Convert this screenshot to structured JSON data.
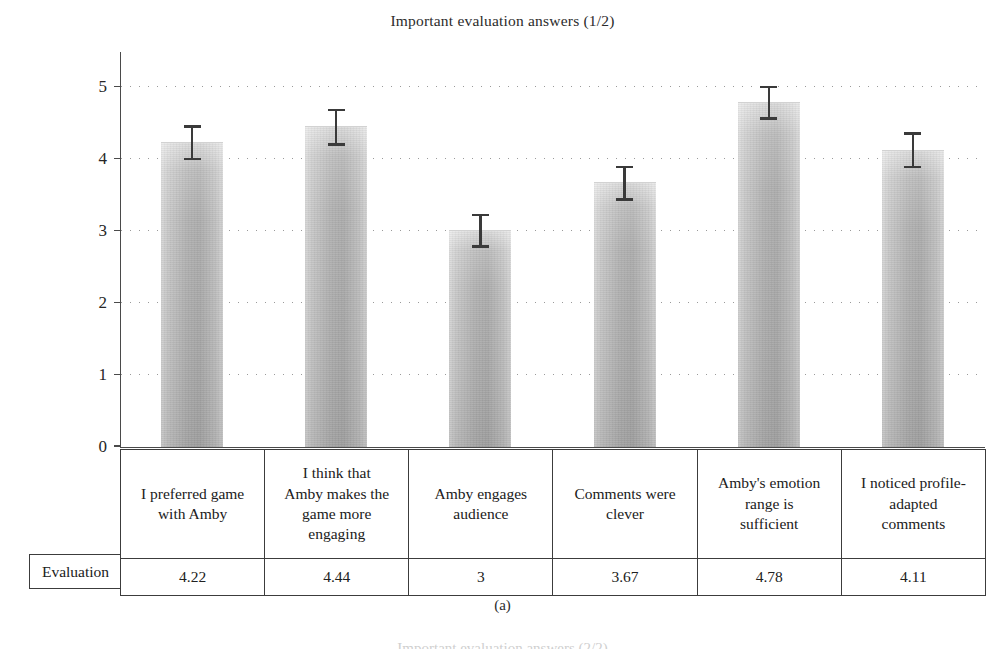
{
  "figure": {
    "title": "Important evaluation answers (1/2)",
    "subcaption": "(a)",
    "next_figure_title": "Important evaluation answers (2/2)",
    "row_header": "Evaluation"
  },
  "chart_data": {
    "type": "bar",
    "title": "Important evaluation answers (1/2)",
    "xlabel": "",
    "ylabel": "",
    "ylim": [
      0,
      5
    ],
    "yticks": [
      0,
      1,
      2,
      3,
      4,
      5
    ],
    "ytick_labels": [
      "0",
      "1",
      "2",
      "3",
      "4",
      "5"
    ],
    "grid": true,
    "grid_style": "dotted",
    "legend": "none",
    "bar_color": "#b4b4b4",
    "error_bar_color": "#3a3a3a",
    "categories": [
      "I preferred game with Amby",
      "I think that Amby makes the game more engaging",
      "Amby engages audience",
      "Comments were clever",
      "Amby's emotion range is sufficient",
      "I noticed profile-adapted comments"
    ],
    "category_lines": [
      [
        "I preferred game",
        "with Amby"
      ],
      [
        "I think that",
        "Amby makes the",
        "game more",
        "engaging"
      ],
      [
        "Amby engages",
        "audience"
      ],
      [
        "Comments were",
        "clever"
      ],
      [
        "Amby's emotion",
        "range is",
        "sufficient"
      ],
      [
        "I noticed profile-",
        "adapted",
        "comments"
      ]
    ],
    "values": [
      4.22,
      4.44,
      3,
      3.67,
      4.78,
      4.11
    ],
    "value_labels": [
      "4.22",
      "4.44",
      "3",
      "3.67",
      "4.78",
      "4.11"
    ],
    "errors_low": [
      4.0,
      4.2,
      2.78,
      3.44,
      4.56,
      3.89
    ],
    "errors_high": [
      4.45,
      4.68,
      3.22,
      3.89,
      5.0,
      4.35
    ],
    "error_amounts": [
      0.23,
      0.24,
      0.22,
      0.22,
      0.22,
      0.23
    ]
  }
}
